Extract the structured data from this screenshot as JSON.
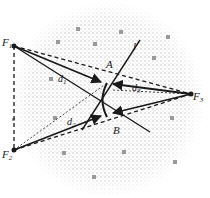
{
  "diagram": {
    "points": {
      "F1": {
        "label": "F",
        "sub": "1",
        "x": 14,
        "y": 46
      },
      "F2": {
        "label": "F",
        "sub": "2",
        "x": 14,
        "y": 150
      },
      "F3": {
        "label": "F",
        "sub": "3",
        "x": 191,
        "y": 94
      },
      "A": {
        "label": "A",
        "x": 107,
        "y": 83
      },
      "B": {
        "label": "B",
        "x": 108,
        "y": 117
      }
    },
    "line_label": "l",
    "distances": {
      "d1": {
        "label": "d",
        "sub": "1"
      },
      "d2": {
        "label": "d",
        "sub": "2"
      },
      "d3": {
        "label": "d",
        "sub": "3"
      }
    },
    "colors": {
      "ink": "#1a1a1a",
      "stipple": "#c8c8c8",
      "dot": "#9a9a9a"
    }
  }
}
